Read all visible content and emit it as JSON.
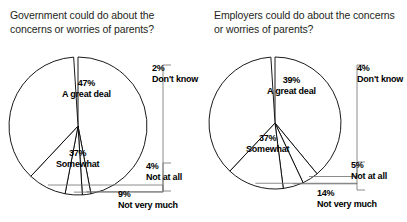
{
  "page": {
    "background": "#ffffff",
    "width": 407,
    "height": 222
  },
  "charts": [
    {
      "id": "government",
      "title": "Government could do about the concerns or worries of parents?",
      "center": {
        "x": 78,
        "y": 126
      },
      "radius": 69,
      "slices": [
        {
          "label": "A great deal",
          "pct": 47,
          "pct_text": "47%",
          "placement": "inside",
          "lx": 62,
          "ly": 78,
          "stroke": "#000000",
          "fill": "#ffffff"
        },
        {
          "label": "Don't know",
          "pct": 2,
          "pct_text": "2%",
          "placement": "outside",
          "lx": 152,
          "ly": 63,
          "stroke": "#000000",
          "fill": "#ffffff"
        },
        {
          "label": "Not at all",
          "pct": 4,
          "pct_text": "4%",
          "placement": "outside",
          "lx": 146,
          "ly": 161,
          "stroke": "#000000",
          "fill": "#ffffff"
        },
        {
          "label": "Not very much",
          "pct": 9,
          "pct_text": "9%",
          "placement": "outside",
          "lx": 118,
          "ly": 189,
          "stroke": "#000000",
          "fill": "#ffffff"
        },
        {
          "label": "Somewhat",
          "pct": 37,
          "pct_text": "37%",
          "placement": "inside",
          "lx": 56,
          "ly": 148,
          "stroke": "#000000",
          "fill": "#ffffff"
        }
      ]
    },
    {
      "id": "employers",
      "title": "Employers could do about the concerns or worries of parents?",
      "center": {
        "x": 71,
        "y": 123
      },
      "radius": 66,
      "slices": [
        {
          "label": "A great deal",
          "pct": 39,
          "pct_text": "39%",
          "placement": "inside",
          "lx": 63,
          "ly": 75,
          "stroke": "#000000",
          "fill": "#ffffff"
        },
        {
          "label": "Don't know",
          "pct": 4,
          "pct_text": "4%",
          "placement": "outside",
          "lx": 153,
          "ly": 63,
          "stroke": "#000000",
          "fill": "#ffffff"
        },
        {
          "label": "Not at all",
          "pct": 5,
          "pct_text": "5%",
          "placement": "outside",
          "lx": 147,
          "ly": 160,
          "stroke": "#000000",
          "fill": "#ffffff"
        },
        {
          "label": "Not very much",
          "pct": 14,
          "pct_text": "14%",
          "placement": "outside",
          "lx": 113,
          "ly": 188,
          "stroke": "#000000",
          "fill": "#ffffff"
        },
        {
          "label": "Somewhat",
          "pct": 37,
          "pct_text": "37%",
          "placement": "inside",
          "lx": 42,
          "ly": 133,
          "stroke": "#000000",
          "fill": "#ffffff"
        }
      ]
    }
  ],
  "chart_data": [
    {
      "type": "pie",
      "title": "Government could do about the concerns or worries of parents?",
      "categories": [
        "A great deal",
        "Somewhat",
        "Not very much",
        "Not at all",
        "Don't know"
      ],
      "values": [
        47,
        37,
        9,
        4,
        2
      ],
      "units": "percent",
      "data_labels": [
        "47%",
        "37%",
        "9%",
        "4%",
        "2%"
      ],
      "legend": "none",
      "grid": false,
      "slice_fill": "#ffffff",
      "slice_stroke": "#000000",
      "start_angle_deg": 0,
      "direction": "clockwise"
    },
    {
      "type": "pie",
      "title": "Employers could do about the concerns or worries of parents?",
      "categories": [
        "A great deal",
        "Somewhat",
        "Not very much",
        "Not at all",
        "Don't know"
      ],
      "values": [
        39,
        37,
        14,
        5,
        4
      ],
      "units": "percent",
      "data_labels": [
        "39%",
        "37%",
        "14%",
        "5%",
        "4%"
      ],
      "legend": "none",
      "grid": false,
      "slice_fill": "#ffffff",
      "slice_stroke": "#000000",
      "start_angle_deg": 0,
      "direction": "clockwise"
    }
  ]
}
